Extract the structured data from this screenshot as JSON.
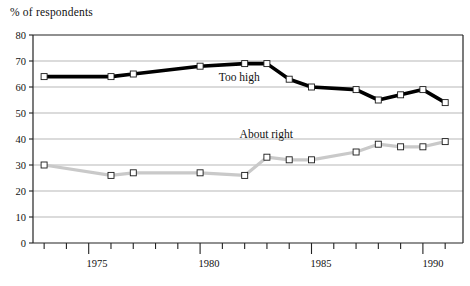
{
  "chart_data": {
    "type": "line",
    "title": "",
    "ylabel": "% of respondents",
    "xlabel": "",
    "ylim": [
      0,
      80
    ],
    "ytick_step": 10,
    "yticks": [
      "0",
      "10",
      "20",
      "30",
      "40",
      "50",
      "60",
      "70",
      "80"
    ],
    "xlim": [
      1972.5,
      1991.8
    ],
    "xticks_labeled": [
      "1975",
      "1980",
      "1985",
      "1990"
    ],
    "xtick_years": [
      1973,
      1974,
      1975,
      1976,
      1977,
      1978,
      1979,
      1980,
      1981,
      1982,
      1983,
      1984,
      1985,
      1986,
      1987,
      1988,
      1989,
      1990,
      1991
    ],
    "grid": "horizontal",
    "legend": "inline-annotations",
    "x": [
      1973,
      1976,
      1977,
      1980,
      1982,
      1983,
      1984,
      1985,
      1987,
      1988,
      1989,
      1990,
      1991
    ],
    "series": [
      {
        "name": "Too high",
        "color": "#000000",
        "marker": "open-square",
        "values": [
          64,
          64,
          65,
          68,
          69,
          69,
          63,
          60,
          59,
          55,
          57,
          59,
          54
        ]
      },
      {
        "name": "About right",
        "color": "#c9c9c9",
        "marker": "open-square",
        "values": [
          30,
          26,
          27,
          27,
          26,
          33,
          32,
          32,
          35,
          38,
          37,
          37,
          39
        ]
      }
    ],
    "annotations": [
      {
        "text": "Too high",
        "x": 1982.0,
        "y": 63.0
      },
      {
        "text": "About right",
        "x": 1983.3,
        "y": 41.0
      }
    ]
  },
  "labels": {
    "axis_title": "% of respondents",
    "series_too_high": "Too high",
    "series_about_right": "About right",
    "y0": "0",
    "y10": "10",
    "y20": "20",
    "y30": "30",
    "y40": "40",
    "y50": "50",
    "y60": "60",
    "y70": "70",
    "y80": "80",
    "x1975": "1975",
    "x1980": "1980",
    "x1985": "1985",
    "x1990": "1990"
  }
}
